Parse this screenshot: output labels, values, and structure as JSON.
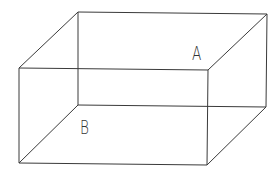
{
  "diagram": {
    "type": "wireframe-box",
    "stroke_color": "#3a3a3a",
    "vertices": {
      "back_top_left": [
        78,
        12
      ],
      "back_top_right": [
        267,
        14
      ],
      "back_bottom_left": [
        78,
        105
      ],
      "back_bottom_right": [
        266,
        107
      ],
      "front_top_left": [
        19,
        68
      ],
      "front_top_right": [
        208,
        70
      ],
      "front_bottom_left": [
        19,
        163
      ],
      "front_bottom_right": [
        207,
        165
      ]
    },
    "labels": [
      {
        "id": "A",
        "text": "A",
        "x": 192,
        "y": 44,
        "size": 19
      },
      {
        "id": "B",
        "text": "B",
        "x": 80,
        "y": 118,
        "size": 19
      }
    ]
  }
}
